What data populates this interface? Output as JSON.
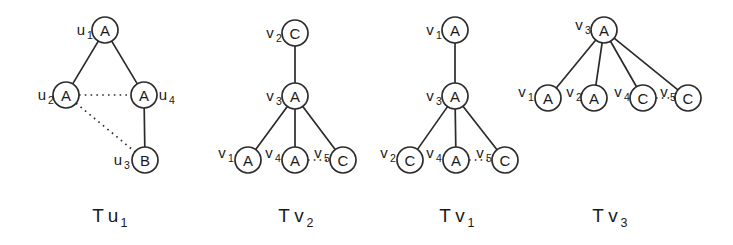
{
  "figure": {
    "background_color": "#ffffff",
    "stroke_color": "#2b2b2b",
    "text_color": "#1a1a1a",
    "node_radius": 13
  },
  "trees": [
    {
      "id": "tree-u1",
      "caption_main": "T",
      "caption_var": "u",
      "caption_sub": "1",
      "caption_text": "Tu1",
      "caption_x": 112,
      "caption_y": 222,
      "nodes": [
        {
          "name": "u1",
          "label": "A",
          "var": "u",
          "sub": "1",
          "cx": 105,
          "cy": 30,
          "label_x": 81,
          "label_y": 35,
          "sub_x": 90,
          "sub_y": 39
        },
        {
          "name": "u2",
          "label": "A",
          "var": "u",
          "sub": "2",
          "cx": 66,
          "cy": 95,
          "label_x": 42,
          "label_y": 100,
          "sub_x": 51,
          "sub_y": 104
        },
        {
          "name": "u4",
          "label": "A",
          "var": "u",
          "sub": "4",
          "cx": 144,
          "cy": 95,
          "label_x": 163,
          "label_y": 100,
          "sub_x": 172,
          "sub_y": 104
        },
        {
          "name": "u3",
          "label": "B",
          "var": "u",
          "sub": "3",
          "cx": 145,
          "cy": 160,
          "label_x": 118,
          "label_y": 165,
          "sub_x": 127,
          "sub_y": 169
        }
      ],
      "edges": [
        {
          "name": "edge-u1-u2",
          "from": "u1",
          "to": "u2",
          "style": "solid"
        },
        {
          "name": "edge-u1-u4",
          "from": "u1",
          "to": "u4",
          "style": "solid"
        },
        {
          "name": "edge-u2-u4",
          "from": "u2",
          "to": "u4",
          "style": "dotted"
        },
        {
          "name": "edge-u2-u3",
          "from": "u2",
          "to": "u3",
          "style": "dotted"
        },
        {
          "name": "edge-u4-u3",
          "from": "u4",
          "to": "u3",
          "style": "solid"
        }
      ]
    },
    {
      "id": "tree-v2",
      "caption_main": "T",
      "caption_var": "v",
      "caption_sub": "2",
      "caption_text": "Tv2",
      "caption_x": 298,
      "caption_y": 222,
      "nodes": [
        {
          "name": "v2",
          "label": "C",
          "var": "v",
          "sub": "2",
          "cx": 295,
          "cy": 33,
          "label_x": 270,
          "label_y": 38,
          "sub_x": 279,
          "sub_y": 42
        },
        {
          "name": "v3",
          "label": "A",
          "var": "v",
          "sub": "3",
          "cx": 295,
          "cy": 96,
          "label_x": 270,
          "label_y": 101,
          "sub_x": 279,
          "sub_y": 105
        },
        {
          "name": "v1",
          "label": "A",
          "var": "v",
          "sub": "1",
          "cx": 248,
          "cy": 160,
          "label_x": 222,
          "label_y": 158,
          "sub_x": 231,
          "sub_y": 162
        },
        {
          "name": "v4",
          "label": "A",
          "var": "v",
          "sub": "4",
          "cx": 295,
          "cy": 160,
          "label_x": 269,
          "label_y": 158,
          "sub_x": 278,
          "sub_y": 162
        },
        {
          "name": "v5",
          "label": "C",
          "var": "v",
          "sub": "5",
          "cx": 343,
          "cy": 160,
          "label_x": 318,
          "label_y": 158,
          "sub_x": 327,
          "sub_y": 162
        }
      ],
      "edges": [
        {
          "name": "edge-v2-v3",
          "from": "v2",
          "to": "v3",
          "style": "solid"
        },
        {
          "name": "edge-v3-v1",
          "from": "v3",
          "to": "v1",
          "style": "solid"
        },
        {
          "name": "edge-v3-v4",
          "from": "v3",
          "to": "v4",
          "style": "solid"
        },
        {
          "name": "edge-v3-v5",
          "from": "v3",
          "to": "v5",
          "style": "solid"
        },
        {
          "name": "edge-v4-v5",
          "from": "v4",
          "to": "v5",
          "style": "dotted"
        }
      ]
    },
    {
      "id": "tree-v1",
      "caption_main": "T",
      "caption_var": "v",
      "caption_sub": "1",
      "caption_text": "Tv1",
      "caption_x": 459,
      "caption_y": 222,
      "nodes": [
        {
          "name": "v1",
          "label": "A",
          "var": "v",
          "sub": "1",
          "cx": 455,
          "cy": 30,
          "label_x": 430,
          "label_y": 35,
          "sub_x": 439,
          "sub_y": 39
        },
        {
          "name": "v3",
          "label": "A",
          "var": "v",
          "sub": "3",
          "cx": 455,
          "cy": 96,
          "label_x": 430,
          "label_y": 101,
          "sub_x": 439,
          "sub_y": 105
        },
        {
          "name": "v2",
          "label": "C",
          "var": "v",
          "sub": "2",
          "cx": 410,
          "cy": 160,
          "label_x": 384,
          "label_y": 158,
          "sub_x": 393,
          "sub_y": 162
        },
        {
          "name": "v4",
          "label": "A",
          "var": "v",
          "sub": "4",
          "cx": 456,
          "cy": 160,
          "label_x": 430,
          "label_y": 158,
          "sub_x": 439,
          "sub_y": 162
        },
        {
          "name": "v5",
          "label": "C",
          "var": "v",
          "sub": "5",
          "cx": 505,
          "cy": 160,
          "label_x": 480,
          "label_y": 158,
          "sub_x": 489,
          "sub_y": 162
        }
      ],
      "edges": [
        {
          "name": "edge-v1-v3",
          "from": "v1",
          "to": "v3",
          "style": "solid"
        },
        {
          "name": "edge-v3-v2",
          "from": "v3",
          "to": "v2",
          "style": "solid"
        },
        {
          "name": "edge-v3-v4",
          "from": "v3",
          "to": "v4",
          "style": "solid"
        },
        {
          "name": "edge-v3-v5",
          "from": "v3",
          "to": "v5",
          "style": "solid"
        },
        {
          "name": "edge-v4-v5",
          "from": "v4",
          "to": "v5",
          "style": "dotted"
        }
      ]
    },
    {
      "id": "tree-v3",
      "caption_main": "T",
      "caption_var": "v",
      "caption_sub": "3",
      "caption_text": "Tv3",
      "caption_x": 612,
      "caption_y": 222,
      "nodes": [
        {
          "name": "v3",
          "label": "A",
          "var": "v",
          "sub": "3",
          "cx": 604,
          "cy": 30,
          "label_x": 579,
          "label_y": 30,
          "sub_x": 588,
          "sub_y": 34
        },
        {
          "name": "v1",
          "label": "A",
          "var": "v",
          "sub": "1",
          "cx": 548,
          "cy": 98,
          "label_x": 522,
          "label_y": 97,
          "sub_x": 531,
          "sub_y": 101
        },
        {
          "name": "v2",
          "label": "A",
          "var": "v",
          "sub": "2",
          "cx": 594,
          "cy": 98,
          "label_x": 570,
          "label_y": 97,
          "sub_x": 579,
          "sub_y": 101
        },
        {
          "name": "v4",
          "label": "C",
          "var": "v",
          "sub": "4",
          "cx": 643,
          "cy": 98,
          "label_x": 618,
          "label_y": 97,
          "sub_x": 627,
          "sub_y": 101
        },
        {
          "name": "v5",
          "label": "C",
          "var": "v",
          "sub": "5",
          "cx": 688,
          "cy": 98,
          "label_x": 664,
          "label_y": 97,
          "sub_x": 673,
          "sub_y": 101
        }
      ],
      "edges": [
        {
          "name": "edge-v3-v1",
          "from": "v3",
          "to": "v1",
          "style": "solid"
        },
        {
          "name": "edge-v3-v2",
          "from": "v3",
          "to": "v2",
          "style": "solid"
        },
        {
          "name": "edge-v3-v4",
          "from": "v3",
          "to": "v4",
          "style": "solid"
        },
        {
          "name": "edge-v3-v5",
          "from": "v3",
          "to": "v5",
          "style": "solid"
        },
        {
          "name": "edge-v4-v5",
          "from": "v4",
          "to": "v5",
          "style": "dotted"
        }
      ]
    }
  ]
}
